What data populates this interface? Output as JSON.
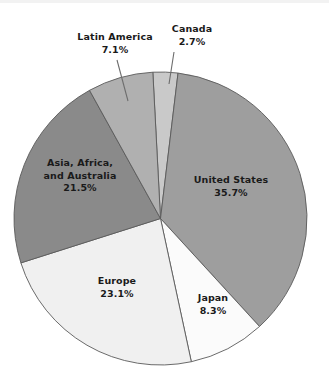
{
  "chart_data": {
    "type": "pie",
    "title": "",
    "subtitle": "",
    "xlabel": "",
    "ylabel": "",
    "legend_position": "none",
    "grid": false,
    "units": "percent",
    "total": 98.4,
    "start_angle_deg": -3,
    "direction": "clockwise",
    "categories": [
      "Canada",
      "United States",
      "Japan",
      "Europe",
      "Asia, Africa, and Australia",
      "Latin America"
    ],
    "values": [
      2.7,
      35.7,
      8.3,
      23.1,
      21.5,
      7.1
    ],
    "slices": [
      {
        "label": "Canada",
        "label_lines": [
          "Canada"
        ],
        "value": 2.7,
        "value_text": "2.7%",
        "color": "#c9c9c9",
        "label_placement": "outside",
        "has_leader_line": true
      },
      {
        "label": "United States",
        "label_lines": [
          "United States"
        ],
        "value": 35.7,
        "value_text": "35.7%",
        "color": "#9e9e9e",
        "label_placement": "inside",
        "has_leader_line": false
      },
      {
        "label": "Japan",
        "label_lines": [
          "Japan"
        ],
        "value": 8.3,
        "value_text": "8.3%",
        "color": "#fbfbfb",
        "label_placement": "inside",
        "has_leader_line": false
      },
      {
        "label": "Europe",
        "label_lines": [
          "Europe"
        ],
        "value": 23.1,
        "value_text": "23.1%",
        "color": "#f0f0f0",
        "label_placement": "inside",
        "has_leader_line": false
      },
      {
        "label": "Asia, Africa, and Australia",
        "label_lines": [
          "Asia, Africa,",
          "and Australia"
        ],
        "value": 21.5,
        "value_text": "21.5%",
        "color": "#8a8a8a",
        "label_placement": "inside",
        "has_leader_line": false
      },
      {
        "label": "Latin America",
        "label_lines": [
          "Latin America"
        ],
        "value": 7.1,
        "value_text": "7.1%",
        "color": "#b0b0b0",
        "label_placement": "outside",
        "has_leader_line": true
      }
    ]
  },
  "labels": {
    "united_states": {
      "name": "United States",
      "pct": "35.7%"
    },
    "japan": {
      "name": "Japan",
      "pct": "8.3%"
    },
    "europe": {
      "name": "Europe",
      "pct": "23.1%"
    },
    "asia": {
      "name_line1": "Asia, Africa,",
      "name_line2": "and Australia",
      "pct": "21.5%"
    },
    "latin_america": {
      "name": "Latin America",
      "pct": "7.1%"
    },
    "canada": {
      "name": "Canada",
      "pct": "2.7%"
    }
  },
  "colors": {
    "canada": "#c9c9c9",
    "united_states": "#9e9e9e",
    "japan": "#fbfbfb",
    "europe": "#f0f0f0",
    "asia": "#8a8a8a",
    "latin_america": "#b0b0b0",
    "slice_outline": "#5a5a5a",
    "leader_line": "#6d6d6d",
    "background": "#ffffff",
    "text": "#1a1a1a"
  }
}
